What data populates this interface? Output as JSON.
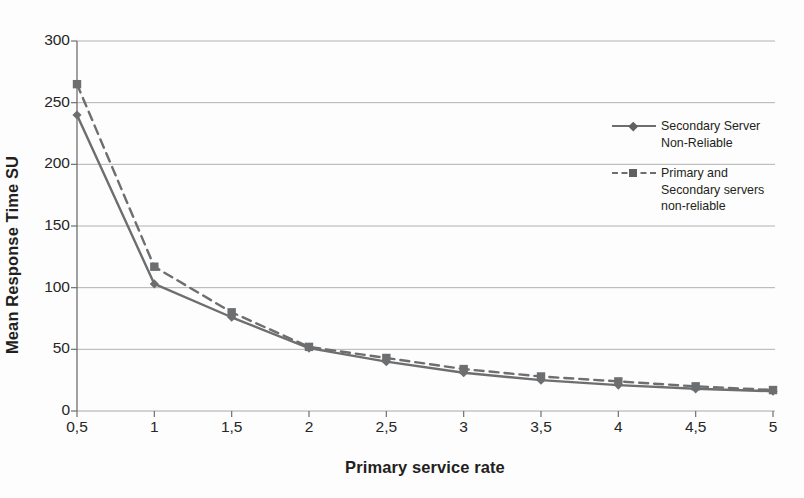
{
  "chart_data": {
    "type": "line",
    "title": "",
    "xlabel": "Primary service rate",
    "ylabel": "Mean Response Time SU",
    "x": [
      0.5,
      1,
      1.5,
      2,
      2.5,
      3,
      3.5,
      4,
      4.5,
      5
    ],
    "xtick_labels": [
      "0,5",
      "1",
      "1,5",
      "2",
      "2,5",
      "3",
      "3,5",
      "4",
      "4,5",
      "5"
    ],
    "ytick_labels": [
      "0",
      "50",
      "100",
      "150",
      "200",
      "250",
      "300"
    ],
    "ytick_values": [
      0,
      50,
      100,
      150,
      200,
      250,
      300
    ],
    "xlim": [
      0.5,
      5
    ],
    "ylim": [
      0,
      300
    ],
    "grid": "horizontal",
    "legend_position": "right",
    "series": [
      {
        "name": "Secondary Server Non-Reliable",
        "name_line1": "Secondary Server",
        "name_line2": "Non-Reliable",
        "style": "solid",
        "marker": "diamond",
        "color": "#6d6e70",
        "values": [
          240,
          103,
          76,
          51,
          40,
          31,
          25,
          21,
          18,
          16
        ]
      },
      {
        "name": "Primary and Secondary servers non-reliable",
        "name_line1": "Primary and",
        "name_line2": "Secondary servers",
        "name_line3": "non-reliable",
        "style": "dashed",
        "marker": "square",
        "color": "#6d6e70",
        "values": [
          265,
          117,
          80,
          52,
          43,
          34,
          28,
          24,
          20,
          17
        ]
      }
    ],
    "colors": {
      "grid": "#9a9a9a",
      "axis": "#6f6f6f",
      "text": "#231f20",
      "series": "#6d6e70",
      "background": "#fdfdfd"
    }
  }
}
